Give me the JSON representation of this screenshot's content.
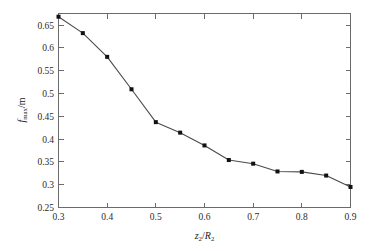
{
  "figure": {
    "background_color": "#ffffff",
    "frame_color": "#6b6b6b",
    "line_color": "#4a4a4a",
    "marker_color": "#111111"
  },
  "axes": {
    "x_label_var": "z",
    "x_label_var_sub": "2",
    "x_label_sep": "/",
    "x_label_den": "R",
    "x_label_den_sub": "2",
    "y_label_var": "f",
    "y_label_var_sub": "max",
    "y_label_unit": "/m",
    "x_ticklabels": [
      "0.3",
      "0.4",
      "0.5",
      "0.6",
      "0.7",
      "0.8",
      "0.9"
    ],
    "y_ticklabels": [
      "0.25",
      "0.3",
      "0.35",
      "0.4",
      "0.45",
      "0.5",
      "0.55",
      "0.6",
      "0.65"
    ]
  },
  "chart_data": {
    "type": "line",
    "title": "",
    "subtitle": "",
    "xlabel": "z2/R2",
    "ylabel": "f_max/m",
    "xlim": [
      0.3,
      0.9
    ],
    "ylim": [
      0.25,
      0.675
    ],
    "grid": false,
    "legend": null,
    "x_ticks": [
      0.3,
      0.4,
      0.5,
      0.6,
      0.7,
      0.8,
      0.9
    ],
    "y_ticks": [
      0.25,
      0.3,
      0.35,
      0.4,
      0.45,
      0.5,
      0.55,
      0.6,
      0.65
    ],
    "x_minor_ticks": [
      0.35,
      0.45,
      0.55,
      0.65,
      0.75,
      0.85
    ],
    "marker": "square",
    "series": [
      {
        "name": "f_max vs z2/R2",
        "x": [
          0.3,
          0.35,
          0.4,
          0.45,
          0.5,
          0.55,
          0.6,
          0.65,
          0.7,
          0.75,
          0.8,
          0.85,
          0.9
        ],
        "values": [
          0.668,
          0.632,
          0.58,
          0.509,
          0.437,
          0.414,
          0.386,
          0.354,
          0.346,
          0.329,
          0.328,
          0.32,
          0.295
        ]
      }
    ]
  }
}
